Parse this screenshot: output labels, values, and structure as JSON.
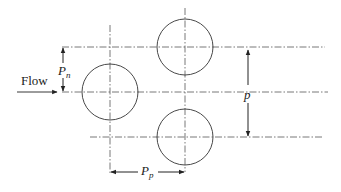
{
  "diagram": {
    "labels": {
      "flow": "Flow",
      "pn_main": "P",
      "pn_sub": "n",
      "p": "p",
      "pp_main": "P",
      "pp_sub": "p"
    },
    "colors": {
      "stroke": "#333333",
      "centerline": "#555555",
      "background": "#ffffff"
    },
    "tubes": [
      {
        "name": "top",
        "cx": 185,
        "cy": 47,
        "r": 28
      },
      {
        "name": "left",
        "cx": 110,
        "cy": 92,
        "r": 28
      },
      {
        "name": "bottom",
        "cx": 185,
        "cy": 137,
        "r": 28
      }
    ],
    "centerlines": {
      "horizontal": [
        {
          "y": 47,
          "x1": 62,
          "x2": 325
        },
        {
          "y": 92,
          "x1": 62,
          "x2": 328
        },
        {
          "y": 137,
          "x1": 90,
          "x2": 322
        }
      ],
      "vertical": [
        {
          "x": 110,
          "y1": 25,
          "y2": 175
        },
        {
          "x": 185,
          "y1": 8,
          "y2": 172
        }
      ]
    },
    "dimensions": {
      "pn": {
        "x": 63,
        "y1": 47,
        "y2": 92
      },
      "p": {
        "x": 248,
        "y1": 49,
        "y2": 136
      },
      "pp": {
        "y": 172,
        "x1": 110,
        "x2": 185
      }
    }
  }
}
